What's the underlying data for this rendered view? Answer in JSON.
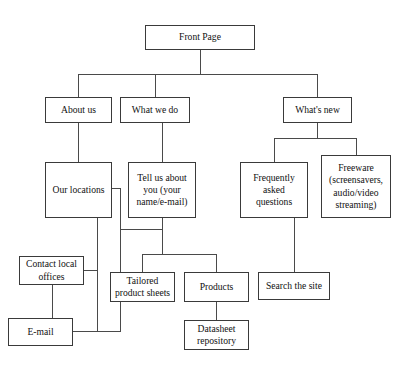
{
  "diagram": {
    "type": "tree-flowchart",
    "canvas": {
      "width": 410,
      "height": 373,
      "background": "#ffffff"
    },
    "style": {
      "box_border": "#3a3a3a",
      "connector": "#4a4a4a",
      "text": "#111111"
    },
    "nodes": [
      {
        "id": "front-page",
        "label": "Front Page",
        "x": 145,
        "y": 25,
        "w": 110,
        "h": 25
      },
      {
        "id": "about-us",
        "label": "About us",
        "x": 45,
        "y": 97,
        "w": 67,
        "h": 26
      },
      {
        "id": "what-we-do",
        "label": "What we do",
        "x": 120,
        "y": 97,
        "w": 70,
        "h": 26
      },
      {
        "id": "whats-new",
        "label": "What's new",
        "x": 283,
        "y": 97,
        "w": 69,
        "h": 26
      },
      {
        "id": "our-locations",
        "label": "Our locations",
        "x": 45,
        "y": 162,
        "w": 67,
        "h": 56
      },
      {
        "id": "tell-us-about-you",
        "label": "Tell us about\nyou (your\nname/e-mail)",
        "x": 128,
        "y": 162,
        "w": 68,
        "h": 56
      },
      {
        "id": "frequently-asked",
        "label": "Frequently\nasked\nquestions",
        "x": 240,
        "y": 162,
        "w": 68,
        "h": 56
      },
      {
        "id": "freeware",
        "label": "Freeware\n(screensavers,\naudio/video\nstreaming)",
        "x": 321,
        "y": 155,
        "w": 70,
        "h": 63
      },
      {
        "id": "contact-local-offices",
        "label": "Contact local\noffices",
        "x": 19,
        "y": 256,
        "w": 65,
        "h": 29
      },
      {
        "id": "email",
        "label": "E-mail",
        "x": 8,
        "y": 318,
        "w": 65,
        "h": 28
      },
      {
        "id": "tailored-sheets",
        "label": "Tailored\nproduct sheets",
        "x": 110,
        "y": 272,
        "w": 65,
        "h": 30
      },
      {
        "id": "products",
        "label": "Products",
        "x": 184,
        "y": 272,
        "w": 65,
        "h": 30
      },
      {
        "id": "search-the-site",
        "label": "Search the site",
        "x": 258,
        "y": 272,
        "w": 72,
        "h": 28
      },
      {
        "id": "datasheet-repository",
        "label": "Datasheet\nrepository",
        "x": 184,
        "y": 320,
        "w": 65,
        "h": 30
      }
    ],
    "edges": [
      {
        "from": "front-page",
        "to": "about-us",
        "path": "M200,50 L200,74 M78,74 L317,74 M78,74 L78,97"
      },
      {
        "from": "front-page",
        "to": "what-we-do",
        "path": "M155,74 L155,97"
      },
      {
        "from": "front-page",
        "to": "whats-new",
        "path": "M317,74 L317,97"
      },
      {
        "from": "about-us",
        "to": "our-locations",
        "path": "M78,123 L78,162"
      },
      {
        "from": "what-we-do",
        "to": "tell-us-about-you",
        "path": "M162,123 L162,162"
      },
      {
        "from": "whats-new",
        "to": "frequently-asked",
        "path": "M317,123 L317,138 M274,138 L356,138 M274,138 L274,162"
      },
      {
        "from": "whats-new",
        "to": "freeware",
        "path": "M356,138 L356,155"
      },
      {
        "from": "our-locations",
        "to": "tell-us-about-you",
        "path": "M112,188 L120,188 L120,229 L162,229"
      },
      {
        "from": "our-locations",
        "to": "contact-local-offices",
        "path": "M97,218 L97,270 L84,270"
      },
      {
        "from": "our-locations",
        "to": "email",
        "path": "M97,270 L97,331 L73,331"
      },
      {
        "from": "contact-local-offices",
        "to": "email",
        "path": "M52,285 L52,318"
      },
      {
        "from": "tell-us-about-you",
        "to": "tailored-sheets",
        "path": "M162,218 L162,254 M142,254 L216,254 M142,254 L142,272"
      },
      {
        "from": "tell-us-about-you",
        "to": "products",
        "path": "M216,254 L216,272"
      },
      {
        "from": "tell-us-about-you",
        "to": "email",
        "path": "M120,229 L120,331 L73,331"
      },
      {
        "from": "products",
        "to": "datasheet-repository",
        "path": "M216,302 L216,320"
      },
      {
        "from": "frequently-asked",
        "to": "search-the-site",
        "path": "M294,218 L294,272"
      }
    ]
  }
}
